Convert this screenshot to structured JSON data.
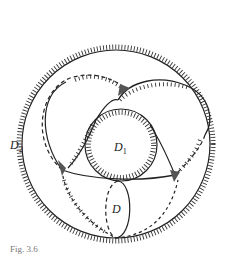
{
  "figure": {
    "labels": {
      "outer": {
        "main": "D",
        "sub": "2"
      },
      "inner": {
        "main": "D",
        "sub": "1"
      },
      "disc": {
        "main": "D",
        "sub": ""
      }
    },
    "caption": "Fig. 3.6"
  }
}
